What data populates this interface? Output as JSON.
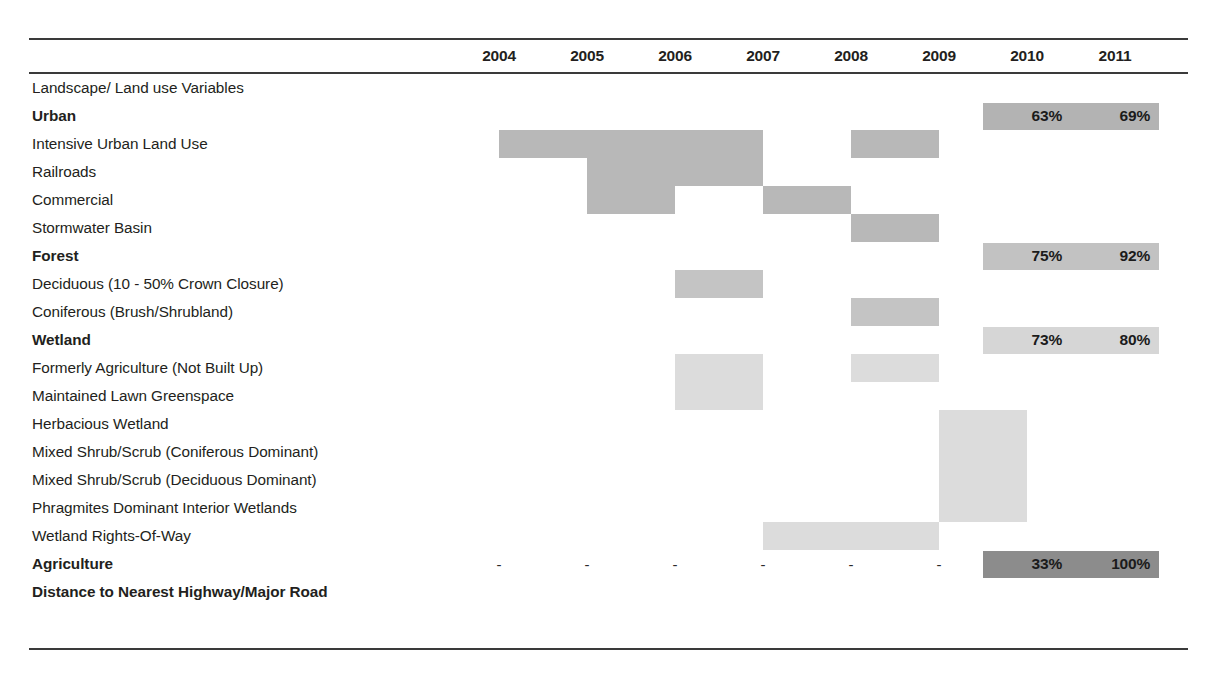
{
  "chart_data": {
    "type": "table",
    "title": "",
    "columns": [
      "2004",
      "2005",
      "2006",
      "2007",
      "2008",
      "2009",
      "2010",
      "2011"
    ],
    "row_label_header": "",
    "rows": [
      {
        "label": "Landscape/ Land use Variables",
        "bold": false,
        "spans": [],
        "percents": null,
        "dashes": false
      },
      {
        "label": "Urban",
        "bold": true,
        "spans": [],
        "percents": {
          "2010": "63%",
          "2011": "69%"
        },
        "band_color": "#b3b3b3",
        "dashes": false
      },
      {
        "label": "Intensive Urban Land Use",
        "bold": false,
        "spans": [
          {
            "from": "2004",
            "to": "2006",
            "color": "#b8b8b8"
          },
          {
            "from": "2008",
            "to": "2008",
            "color": "#b8b8b8"
          }
        ],
        "percents": null,
        "dashes": false
      },
      {
        "label": "Railroads",
        "bold": false,
        "spans": [
          {
            "from": "2005",
            "to": "2006",
            "color": "#b8b8b8"
          }
        ],
        "percents": null,
        "dashes": false
      },
      {
        "label": "Commercial",
        "bold": false,
        "spans": [
          {
            "from": "2005",
            "to": "2005",
            "color": "#b8b8b8"
          },
          {
            "from": "2007",
            "to": "2007",
            "color": "#b8b8b8"
          }
        ],
        "percents": null,
        "dashes": false
      },
      {
        "label": "Stormwater Basin",
        "bold": false,
        "spans": [
          {
            "from": "2008",
            "to": "2008",
            "color": "#b8b8b8"
          }
        ],
        "percents": null,
        "dashes": false
      },
      {
        "label": "Forest",
        "bold": true,
        "spans": [],
        "percents": {
          "2010": "75%",
          "2011": "92%"
        },
        "band_color": "#c2c2c2",
        "dashes": false
      },
      {
        "label": "Deciduous (10 - 50% Crown Closure)",
        "bold": false,
        "spans": [
          {
            "from": "2006",
            "to": "2006",
            "color": "#c4c4c4"
          }
        ],
        "percents": null,
        "dashes": false
      },
      {
        "label": "Coniferous (Brush/Shrubland)",
        "bold": false,
        "spans": [
          {
            "from": "2008",
            "to": "2008",
            "color": "#c4c4c4"
          }
        ],
        "percents": null,
        "dashes": false
      },
      {
        "label": "Wetland",
        "bold": true,
        "spans": [],
        "percents": {
          "2010": "73%",
          "2011": "80%"
        },
        "band_color": "#d6d6d6",
        "dashes": false
      },
      {
        "label": "Formerly Agriculture (Not Built Up)",
        "bold": false,
        "spans": [
          {
            "from": "2006",
            "to": "2006",
            "color": "#dcdcdc"
          },
          {
            "from": "2008",
            "to": "2008",
            "color": "#dcdcdc"
          }
        ],
        "percents": null,
        "dashes": false
      },
      {
        "label": "Maintained Lawn Greenspace",
        "bold": false,
        "spans": [
          {
            "from": "2006",
            "to": "2006",
            "color": "#dcdcdc"
          }
        ],
        "percents": null,
        "dashes": false
      },
      {
        "label": "Herbacious Wetland",
        "bold": false,
        "spans": [
          {
            "from": "2009",
            "to": "2009",
            "color": "#dcdcdc"
          }
        ],
        "percents": null,
        "dashes": false
      },
      {
        "label": "Mixed Shrub/Scrub (Coniferous Dominant)",
        "bold": false,
        "spans": [
          {
            "from": "2009",
            "to": "2009",
            "color": "#dcdcdc"
          }
        ],
        "percents": null,
        "dashes": false
      },
      {
        "label": "Mixed Shrub/Scrub (Deciduous Dominant)",
        "bold": false,
        "spans": [
          {
            "from": "2009",
            "to": "2009",
            "color": "#dcdcdc"
          }
        ],
        "percents": null,
        "dashes": false
      },
      {
        "label": "Phragmites Dominant Interior Wetlands",
        "bold": false,
        "spans": [
          {
            "from": "2009",
            "to": "2009",
            "color": "#dcdcdc"
          }
        ],
        "percents": null,
        "dashes": false
      },
      {
        "label": "Wetland Rights-Of-Way",
        "bold": false,
        "spans": [
          {
            "from": "2007",
            "to": "2008",
            "color": "#dcdcdc"
          }
        ],
        "percents": null,
        "dashes": false
      },
      {
        "label": "Agriculture",
        "bold": true,
        "spans": [],
        "percents": {
          "2010": "33%",
          "2011": "100%"
        },
        "band_color": "#8c8c8c",
        "dashes": true,
        "dash_char": "-"
      },
      {
        "label": "Distance to Nearest Highway/Major Road",
        "bold": true,
        "spans": [],
        "percents": null,
        "dashes": false
      }
    ],
    "colors": {
      "urban_band": "#b3b3b3",
      "forest_band": "#c2c2c2",
      "wetland_band": "#d6d6d6",
      "agriculture_band": "#8c8c8c",
      "urban_bar": "#b8b8b8",
      "forest_bar": "#c4c4c4",
      "wetland_bar": "#dcdcdc",
      "rule": "#3a3a3a",
      "text": "#231f20"
    },
    "legend": []
  }
}
